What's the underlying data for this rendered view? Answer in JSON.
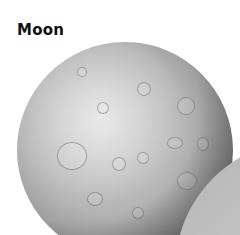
{
  "title": "Moon",
  "image": {
    "subject": "moon-sphere",
    "description": "Grayscale cratered sphere of the Moon with a second gray curved body overlapping at bottom-right"
  },
  "colors": {
    "background": "#ffffff",
    "title": "#111111",
    "moon_light": "#cfcfcf",
    "moon_shadow": "#3a3a3a",
    "other_body": "#c6c6c6"
  }
}
